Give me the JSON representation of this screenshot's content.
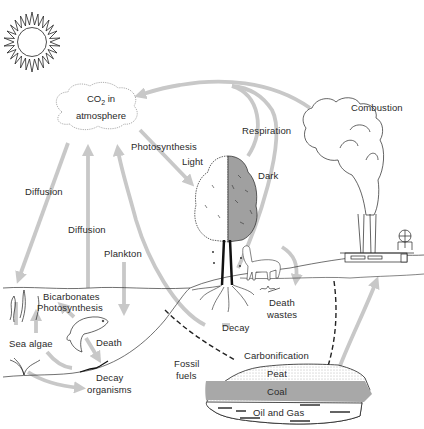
{
  "diagram": {
    "colors": {
      "arrow": "#c8c8c8",
      "line": "#222222",
      "coal": "#a8a8a8",
      "tree_dark_side": "#a0a0a0",
      "background": "#ffffff"
    },
    "nodes": {
      "sun": {
        "icon": "sun-icon"
      },
      "co2": {
        "label_main": "CO",
        "label_sub": "2",
        "label_tail": " in",
        "label_line2": "atmosphere"
      },
      "combustion": {
        "label": "Combustion"
      },
      "factory": {
        "icon": "factory-icon"
      },
      "tree": {
        "icon": "tree-icon"
      },
      "animal": {
        "icon": "goat-icon"
      },
      "fish": {
        "icon": "fish-icon"
      },
      "sea_algae": {
        "label": "Sea algae"
      },
      "fossil_fuels": {
        "label_line1": "Fossil",
        "label_line2": "fuels"
      },
      "deposits": {
        "layers": [
          "Peat",
          "Coal",
          "Oil and Gas"
        ]
      }
    },
    "labels": {
      "photosynthesis": "Photosynthesis",
      "light": "Light",
      "dark": "Dark",
      "respiration": "Respiration",
      "diffusion_left": "Diffusion",
      "diffusion_center": "Diffusion",
      "plankton": "Plankton",
      "bicarbonates": "Bicarbonates",
      "photosynthesis_sea": "Photosynthesis",
      "death_sea": "Death",
      "decay_organisms_line1": "Decay",
      "decay_organisms_line2": "organisms",
      "decay": "Decay",
      "death_wastes_line1": "Death",
      "death_wastes_line2": "wastes",
      "carbonification": "Carbonification"
    },
    "edges": [
      {
        "from": "combustion",
        "to": "co2",
        "style": "solid-gray-arrow"
      },
      {
        "from": "tree-dark",
        "to": "co2",
        "label": "Respiration",
        "style": "solid-gray-arrow"
      },
      {
        "from": "animal",
        "to": "co2",
        "style": "solid-gray-arrow"
      },
      {
        "from": "co2",
        "to": "tree-light",
        "label": "Photosynthesis",
        "style": "solid-gray-arrow"
      },
      {
        "from": "co2",
        "to": "sea",
        "label": "Diffusion",
        "style": "solid-gray-arrow"
      },
      {
        "from": "sea",
        "to": "co2",
        "label": "Diffusion",
        "style": "solid-gray-arrow"
      },
      {
        "from": "decay",
        "to": "co2",
        "style": "solid-gray-arrow"
      },
      {
        "from": "plankton",
        "to": "sea",
        "label": "Plankton",
        "style": "solid-gray-arrow"
      },
      {
        "from": "animal",
        "to": "death-wastes",
        "style": "solid-gray-arrow"
      },
      {
        "from": "tree-roots",
        "to": "sea-floor",
        "label": "Decay",
        "style": "solid-gray-arrow"
      },
      {
        "from": "sea-floor",
        "to": "fossil-fuels",
        "style": "dashed"
      },
      {
        "from": "death-wastes",
        "to": "fossil-fuels",
        "style": "dashed"
      },
      {
        "from": "fossil-fuels",
        "to": "factory",
        "style": "solid-gray-arrow"
      }
    ]
  }
}
